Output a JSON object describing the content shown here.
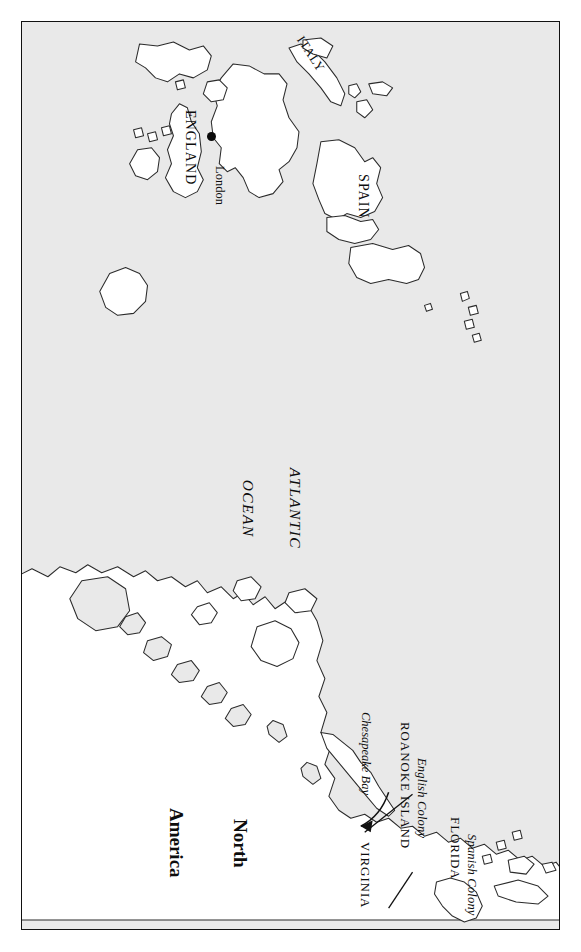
{
  "map": {
    "title": "North Atlantic colonial map",
    "orientation": "rotated-90",
    "colors": {
      "ocean": "#e9e9e9",
      "land": "#ffffff",
      "coastline": "#2b2b2b",
      "border": "#111111",
      "label": "#0d0d0d",
      "marker": "#0a0a0a"
    },
    "ocean_labels": [
      {
        "name": "atlantic-ocean",
        "line1": "ATLANTIC",
        "line2": "OCEAN"
      }
    ],
    "continent_labels": [
      {
        "name": "north-america",
        "line1": "North",
        "line2": "America"
      }
    ],
    "country_labels": [
      {
        "name": "england",
        "text": "ENGLAND"
      },
      {
        "name": "italy",
        "text": "ITALY"
      },
      {
        "name": "spain",
        "text": "SPAIN"
      }
    ],
    "city_labels": [
      {
        "name": "london",
        "text": "London",
        "marker": "city-dot"
      }
    ],
    "region_labels": [
      {
        "name": "virginia",
        "text": "VIRGINIA",
        "subtitle": ""
      },
      {
        "name": "roanoke-island",
        "text": "ROANOKE ISLAND",
        "subtitle": "English Colony"
      },
      {
        "name": "florida",
        "text": "FLORIDA",
        "subtitle": "Spanish Colony"
      }
    ],
    "feature_labels": [
      {
        "name": "chesapeake-bay",
        "text": "Chesapeake Bay",
        "annotation": "curved-arrow"
      }
    ]
  }
}
